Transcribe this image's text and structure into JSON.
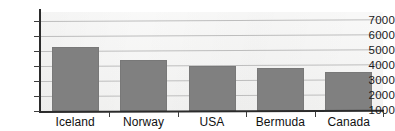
{
  "title_fragment": "",
  "chart_data": {
    "type": "bar",
    "title": "",
    "subtitle": "",
    "xlabel": "",
    "ylabel": "",
    "categories": [
      "Iceland",
      "Norway",
      "USA",
      "Bermuda",
      "Canada"
    ],
    "values": [
      5250,
      4400,
      3980,
      3870,
      3620
    ],
    "series": [
      {
        "name": "",
        "values": [
          5250,
          4400,
          3980,
          3870,
          3620
        ]
      }
    ],
    "ylim": [
      1000,
      7600
    ],
    "y_ticks": [
      1000,
      2000,
      3000,
      4000,
      5000,
      6000,
      7000
    ],
    "y_tick_labels": [
      "1000",
      "2000",
      "3000",
      "4000",
      "5000",
      "6000",
      "7000"
    ],
    "x_tick_labels": [
      "Iceland",
      "Norway",
      "USA",
      "Bermuda",
      "Canada"
    ],
    "grid": true,
    "grid_axis": "y",
    "legend": false,
    "legend_position": "none",
    "bar_color": "#808080",
    "plot_background": "#f4f4f3",
    "gridline_color": "#bdbdbd",
    "axis_color": "#2b2b2b",
    "text_color": "#111111",
    "annotations": []
  }
}
